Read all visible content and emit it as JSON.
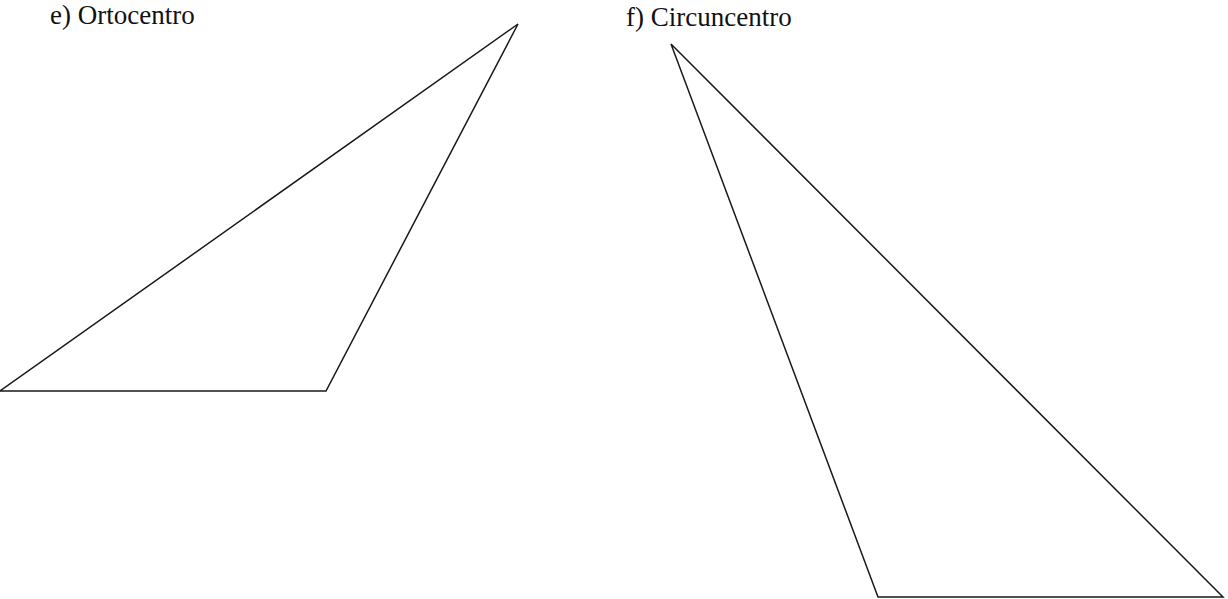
{
  "exercises": [
    {
      "id": "e",
      "label": "e) Ortocentro",
      "triangle": {
        "vertices": [
          [
            0,
            391
          ],
          [
            326,
            391
          ],
          [
            518,
            24
          ]
        ]
      }
    },
    {
      "id": "f",
      "label": "f) Circuncentro",
      "triangle": {
        "vertices": [
          [
            671,
            44
          ],
          [
            878,
            597
          ],
          [
            1223,
            597
          ]
        ]
      }
    }
  ],
  "colors": {
    "background": "#ffffff",
    "stroke": "#1a1a1a",
    "text": "#111111"
  }
}
